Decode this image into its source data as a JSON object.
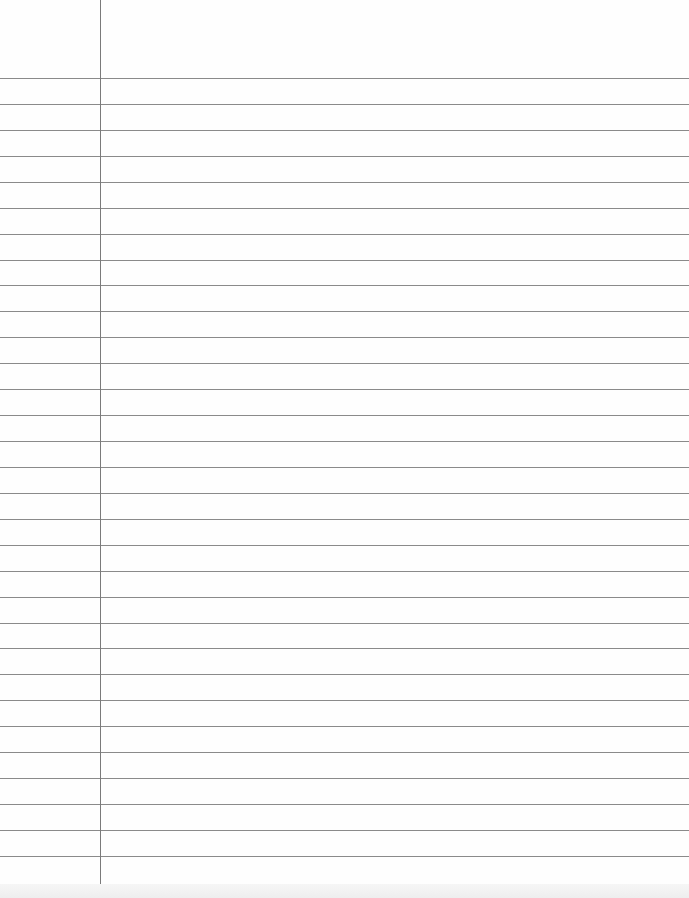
{
  "document": {
    "type": "lined-paper",
    "rules": {
      "first_y": 78,
      "spacing": 25.93,
      "count": 31,
      "color": "#8a8a8a"
    },
    "margin_line": {
      "x": 100,
      "color": "#7a7a7a"
    },
    "paper_color": "#fefefe"
  }
}
